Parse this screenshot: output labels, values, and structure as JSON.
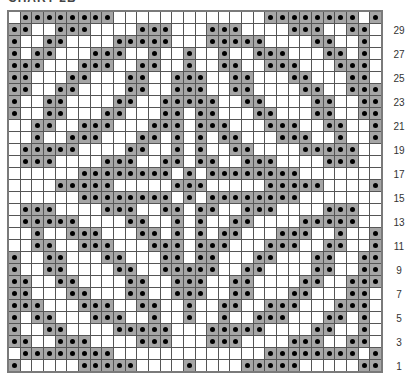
{
  "title": "CHART 2B",
  "legend": {
    "filled": "contrast-color stitch",
    "empty": "main-color stitch"
  },
  "colors": {
    "filled_cell": "#a6a6a6",
    "dot": "#000000",
    "empty_cell": "#ffffff",
    "grid_line": "#555555"
  },
  "chart_data": {
    "type": "heatmap",
    "title": "CHART 2B",
    "columns": 32,
    "rows": 30,
    "row_order": "top-to-bottom from row 30 down to row 1",
    "row_labels": [
      "29",
      "27",
      "25",
      "23",
      "21",
      "19",
      "17",
      "15",
      "13",
      "11",
      "9",
      "7",
      "5",
      "3",
      "1"
    ],
    "row_label_rows": [
      29,
      27,
      25,
      23,
      21,
      19,
      17,
      15,
      13,
      11,
      9,
      7,
      5,
      3,
      1
    ],
    "grid": [
      "01111111100000000000001111111101",
      "11001110000111000111000011100110",
      "10011000011111000111110000110010",
      "10110001110010010010011100011010",
      "11100011100110010011001110001110",
      "11000110001100111001100011000110",
      "11001100001100111001100001100111",
      "10011000011001111100110000110011",
      "10011000110001101100011000110011",
      "00110011100011101110001110011001",
      "00100111000110101011000111001001",
      "01111100001100101001100001111100",
      "01110000111001101100111000011100",
      "00000011111111010111111110000000",
      "00001111100000111000001111100001",
      "00000011111111010111111110000000",
      "01110000111001101100111000011100",
      "01111100001100101001100001111100",
      "00100111000110101011000111001001",
      "00110011100011101110001110011001",
      "10011000110001101100011000110011",
      "10011000011001111100110000110011",
      "11001100001100111001100001100111",
      "11000110001100111001100011000110",
      "11100011100110010011001110001110",
      "10110001110010010010011100011010",
      "10011000011111000111110000110010",
      "11001110000111000111000011100110",
      "01111111100000000000001111111101",
      "10000011111000010000111110000011"
    ]
  }
}
